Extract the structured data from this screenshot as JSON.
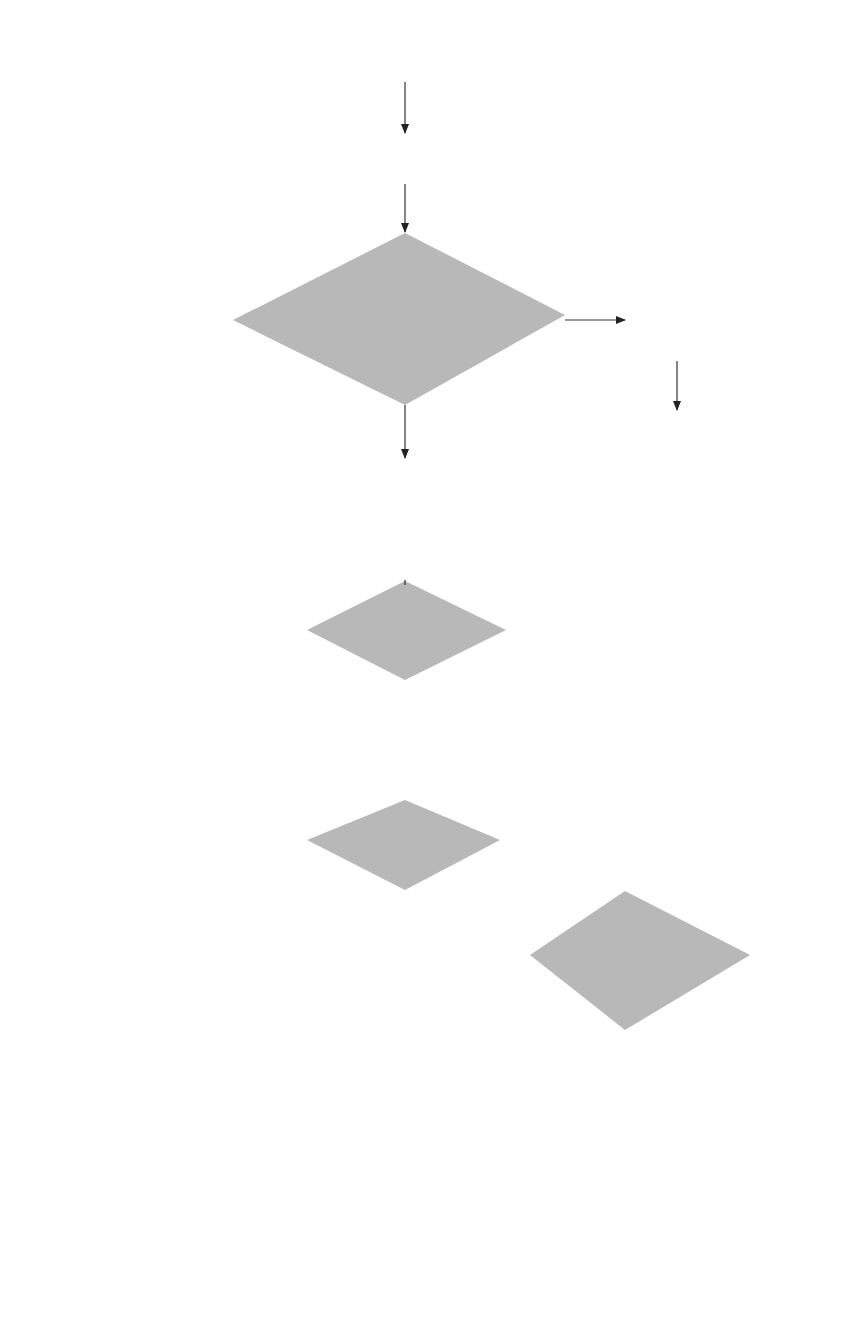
{
  "diagram": {
    "type": "flowchart",
    "fill_color": "#b8b8b8",
    "line_color": "#333333",
    "nodes": {
      "begin": {
        "shape": "terminal",
        "text": "Begin"
      },
      "init": {
        "shape": "process",
        "text": "Initialize stack to one\ncell, holding $."
      },
      "accept_check": {
        "shape": "decision",
        "text": "Does stack hold\nonly $ and the distin-\nguished symbol, while\ninput holds only $?"
      },
      "parse_done": {
        "shape": "process",
        "text": "Parse tree\nhas been\nconstructed"
      },
      "end1": {
        "shape": "terminal",
        "text": "End"
      },
      "lookup": {
        "shape": "process",
        "text": "Let X be on top of stack\nand Y be the first input\nsymbol. Let T be the entry\nin the shift-reduce table\nfor row X and column Y."
      },
      "blank_check": {
        "shape": "decision",
        "text": "T is blank?"
      },
      "error": {
        "shape": "process",
        "text": "Input is\nnot a\nsentence."
      },
      "end2": {
        "shape": "terminal",
        "text": "End"
      },
      "reduce_check": {
        "shape": "decision",
        "text": "T is R?"
      },
      "shift": {
        "shape": "process",
        "text": "Remove Y from top\nof the input, and push\nY on top of the stack.\nCreate a new node\nlabeled Y and put a\npointer to the node in\nthe new top stack record."
      },
      "rhs_check": {
        "shape": "decision",
        "text": "Is there a\nright side at\nthe top of\nthe stack?"
      },
      "reduce": {
        "shape": "process",
        "text": "Let A → X1 ··· Xn be the\nlongest right side on\ntop of the stack. Create\na new node N labeled A. Make\nthe children of N be the nodes\npointed to by the top n stack\nrecords, lowest at the left,\ntopmost at the right. Pop the\ntop n stack records and push down\na new top record holding\nsymbol A and a pointer to N."
      }
    },
    "edge_labels": {
      "accept_yes": "Yes",
      "accept_no": "No",
      "blank_yes": "Yes",
      "blank_no": "No",
      "reduce_no": "No",
      "reduce_yes": "Yes",
      "rhs_no": "No",
      "rhs_yes": "Yes"
    },
    "edges": [
      {
        "from": "begin",
        "to": "init"
      },
      {
        "from": "init",
        "to": "accept_check"
      },
      {
        "from": "accept_check",
        "to": "parse_done",
        "label": "Yes"
      },
      {
        "from": "parse_done",
        "to": "end1"
      },
      {
        "from": "accept_check",
        "to": "lookup",
        "label": "No"
      },
      {
        "from": "lookup",
        "to": "blank_check"
      },
      {
        "from": "blank_check",
        "to": "error",
        "label": "Yes"
      },
      {
        "from": "error",
        "to": "end2"
      },
      {
        "from": "blank_check",
        "to": "reduce_check",
        "label": "No"
      },
      {
        "from": "reduce_check",
        "to": "shift",
        "label": "No"
      },
      {
        "from": "reduce_check",
        "to": "rhs_check",
        "label": "Yes"
      },
      {
        "from": "rhs_check",
        "to": "error",
        "label": "No"
      },
      {
        "from": "rhs_check",
        "to": "reduce",
        "label": "Yes"
      },
      {
        "from": "shift",
        "to": "accept_check"
      },
      {
        "from": "reduce",
        "to": "accept_check"
      }
    ]
  }
}
